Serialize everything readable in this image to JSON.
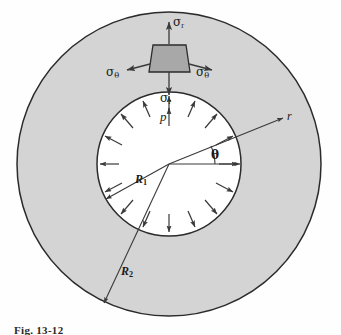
{
  "figure": {
    "kind": "thick-walled-cylinder-cross-section",
    "caption": "Fig. 13-12",
    "colors": {
      "wall_fill": "#d4d4d4",
      "hole_fill": "#ffffff",
      "outline": "#2b2b2b",
      "element_fill": "#a8a8a8",
      "arrow": "#3a3a3a",
      "background": "#fefefe"
    },
    "geometry": {
      "center_x": 169,
      "center_y": 164,
      "outer_radius": 152,
      "inner_radius": 72,
      "theta_degrees": 22
    }
  },
  "labels": {
    "sigma_r_top": "σ",
    "sigma_r_top_sub": "r",
    "sigma_r_bottom": "σ",
    "sigma_r_bottom_sub": "r",
    "sigma_theta_left": "σ",
    "sigma_theta_left_sub": "θ",
    "sigma_theta_right": "σ",
    "sigma_theta_right_sub": "θ",
    "pressure": "p",
    "radius_vector": "r",
    "angle": "θ",
    "inner_radius": "R",
    "inner_radius_sub": "1",
    "outer_radius": "R",
    "outer_radius_sub": "2"
  },
  "annotations": {
    "internal_pressure_arrow_count": 16,
    "pressure_direction": "radially-outward-from-hole",
    "stress_element_shape": "trapezoid",
    "stress_element_position": "top-of-wall"
  }
}
